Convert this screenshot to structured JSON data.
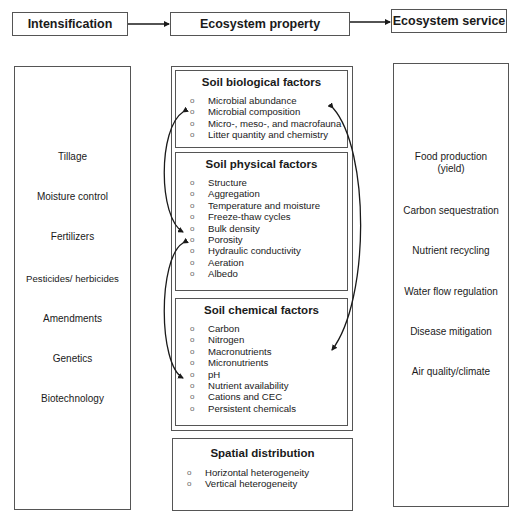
{
  "headers": {
    "intensification": "Intensification",
    "property": "Ecosystem property",
    "service": "Ecosystem service"
  },
  "intensification_items": [
    "Tillage",
    "Moisture control",
    "Fertilizers",
    "Pesticides/ herbicides",
    "Amendments",
    "Genetics",
    "Biotechnology"
  ],
  "service_items": [
    "Food production",
    "(yield)",
    "Carbon sequestration",
    "Nutrient recycling",
    "Water flow regulation",
    "Disease mitigation",
    "Air quality/climate"
  ],
  "property_sections": {
    "biological": {
      "title": "Soil biological factors",
      "items": [
        "Microbial abundance",
        "Microbial composition",
        "Micro-, meso-, and macrofauna",
        "Litter quantity and chemistry"
      ]
    },
    "physical": {
      "title": "Soil physical factors",
      "items": [
        "Structure",
        "Aggregation",
        "Temperature and moisture",
        "Freeze-thaw cycles",
        "Bulk density",
        "Porosity",
        "Hydraulic conductivity",
        "Aeration",
        "Albedo"
      ]
    },
    "chemical": {
      "title": "Soil chemical factors",
      "items": [
        "Carbon",
        "Nitrogen",
        "Macronutrients",
        "Micronutrients",
        "pH",
        "Nutrient availability",
        "Cations and CEC",
        "Persistent chemicals"
      ]
    },
    "spatial": {
      "title": "Spatial distribution",
      "items": [
        "Horizontal heterogeneity",
        "Vertical heterogeneity"
      ]
    }
  },
  "bullet_glyph": "o",
  "colors": {
    "line": "#555555",
    "arrow": "#1a1a1a",
    "text": "#1a1a1a"
  }
}
